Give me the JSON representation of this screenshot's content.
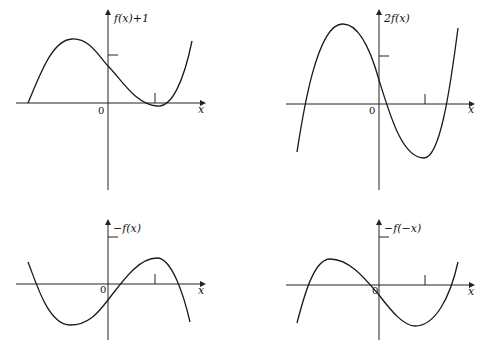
{
  "figure": {
    "panels": [
      {
        "id": "top-left",
        "y_label": "f(x)+1",
        "x_label": "x",
        "origin_label": "0",
        "axes": {
          "x_from": 16,
          "x_to": 203,
          "y_axis_x": 108,
          "x_axis_y": 103,
          "y_top": 12,
          "y_bottom": 190
        },
        "y_tick": {
          "y": 55
        },
        "x_tick": {
          "x": 155
        },
        "curve": "M28,103 C40,75 52,40 72,39 C90,38 100,58 108,66 C122,80 135,104 157,106 C172,108 184,80 192,41",
        "label_pos": {
          "x": 114,
          "y": 22
        },
        "zero_pos": {
          "x": 98,
          "y": 114
        },
        "xlabel_pos": {
          "x": 198,
          "y": 113
        }
      },
      {
        "id": "top-right",
        "y_label": "2f(x)",
        "x_label": "x",
        "origin_label": "0",
        "axes": {
          "x_from": 286,
          "x_to": 472,
          "y_axis_x": 379,
          "x_axis_y": 104,
          "y_top": 12,
          "y_bottom": 190
        },
        "y_tick": {
          "y": 56
        },
        "x_tick": {
          "x": 425
        },
        "curve": "M297,152 C302,120 316,25 342,24 C362,23 374,62 379,80 C390,115 402,158 424,158 C440,158 450,90 458,28",
        "label_pos": {
          "x": 384,
          "y": 22
        },
        "zero_pos": {
          "x": 369,
          "y": 114
        },
        "xlabel_pos": {
          "x": 468,
          "y": 113
        }
      },
      {
        "id": "bottom-left",
        "y_label": "−f(x)",
        "x_label": "x",
        "origin_label": "0",
        "axes": {
          "x_from": 16,
          "x_to": 203,
          "y_axis_x": 108,
          "x_axis_y": 284,
          "y_top": 222,
          "y_bottom": 340
        },
        "y_tick": {
          "y": 237
        },
        "x_tick": {
          "x": 155
        },
        "curve": "M28,262 C36,282 48,325 70,325 C90,325 100,310 108,300 C122,282 138,258 157,258 C172,258 184,296 190,322",
        "label_pos": {
          "x": 113,
          "y": 232
        },
        "zero_pos": {
          "x": 100,
          "y": 293
        },
        "xlabel_pos": {
          "x": 198,
          "y": 294
        }
      },
      {
        "id": "bottom-right",
        "y_label": "−f(−x)",
        "x_label": "x",
        "origin_label": "0",
        "axes": {
          "x_from": 286,
          "x_to": 472,
          "y_axis_x": 379,
          "x_axis_y": 285,
          "y_top": 222,
          "y_bottom": 340
        },
        "y_tick": {
          "y": 237
        },
        "x_tick": {
          "x": 425
        },
        "curve": "M297,323 C304,296 314,259 330,259 C350,259 366,280 379,295 C392,312 404,326 415,326 C435,326 450,298 458,262",
        "label_pos": {
          "x": 384,
          "y": 232
        },
        "zero_pos": {
          "x": 372,
          "y": 294
        },
        "xlabel_pos": {
          "x": 468,
          "y": 295
        }
      }
    ]
  }
}
